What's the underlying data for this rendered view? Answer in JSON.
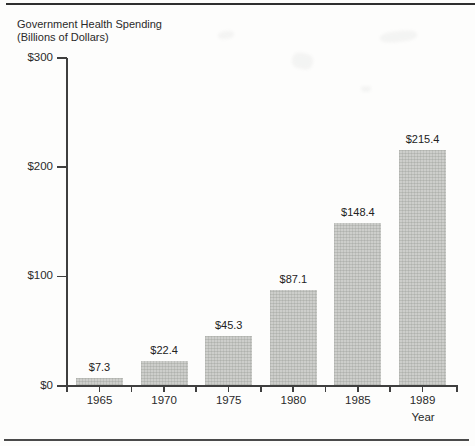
{
  "figure": {
    "title_line1": "Government Health Spending",
    "title_line2": "(Billions of Dollars)"
  },
  "chart_data": {
    "type": "bar",
    "title": "Government Health Spending (Billions of Dollars)",
    "xlabel": "Year",
    "ylabel": "",
    "categories": [
      "1965",
      "1970",
      "1975",
      "1980",
      "1985",
      "1989"
    ],
    "values": [
      7.3,
      22.4,
      45.3,
      87.1,
      148.4,
      215.4
    ],
    "value_labels": [
      "$7.3",
      "$22.4",
      "$45.3",
      "$87.1",
      "$148.4",
      "$215.4"
    ],
    "y_ticks": [
      {
        "value": 0,
        "label": "$0"
      },
      {
        "value": 100,
        "label": "$100"
      },
      {
        "value": 200,
        "label": "$200"
      },
      {
        "value": 300,
        "label": "$300"
      }
    ],
    "ylim": [
      0,
      300
    ],
    "grid": false,
    "legend": null,
    "bar_color": "#c9cac7",
    "axis_color": "#3f3f3f"
  }
}
